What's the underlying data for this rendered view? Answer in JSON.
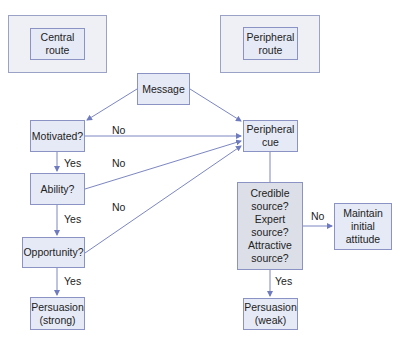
{
  "routes": {
    "central": "Central\nroute",
    "peripheral": "Peripheral\nroute"
  },
  "nodes": {
    "message": "Message",
    "motivated": "Motivated?",
    "ability": "Ability?",
    "opportunity": "Opportunity?",
    "persuasion_strong": "Persuasion\n(strong)",
    "peripheral_cue": "Peripheral\ncue",
    "source_check": "Credible\nsource?\nExpert\nsource?\nAttractive\nsource?",
    "maintain": "Maintain\ninitial\nattitude",
    "persuasion_weak": "Persuasion\n(weak)"
  },
  "edge_labels": {
    "motivated_no": "No",
    "motivated_yes": "Yes",
    "ability_no": "No",
    "ability_yes": "Yes",
    "opportunity_no": "No",
    "opportunity_yes": "Yes",
    "source_no": "No",
    "source_yes": "Yes"
  },
  "colors": {
    "box_fill": "#e6eaf7",
    "box_border": "#8a93c4",
    "gray_fill": "#dcdfe8",
    "arrow": "#6f7bbf"
  }
}
